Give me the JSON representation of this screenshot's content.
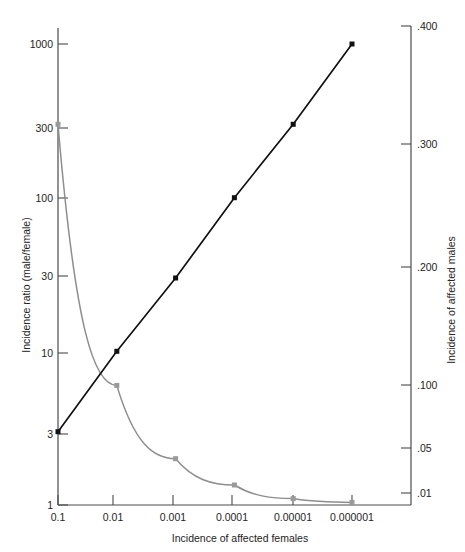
{
  "chart_data": {
    "type": "line",
    "title": "",
    "xlabel": "Incidence of affected females",
    "ylabel": "Incidence ratio (male/female)",
    "y2label": "Incidence of affected males",
    "xscale": "log",
    "yscale": "log",
    "y2scale": "log",
    "xticks": [
      "0.1",
      "0.01",
      "0.001",
      "0.0001",
      "0.00001",
      "0.000001"
    ],
    "xtick_values": [
      0.1,
      0.01,
      0.001,
      0.0001,
      1e-05,
      1e-06
    ],
    "yticks": [
      "1000",
      "300",
      "100",
      "30",
      "10",
      "3",
      "1"
    ],
    "ytick_values": [
      1000,
      300,
      100,
      30,
      10,
      3,
      1
    ],
    "ylim": [
      1,
      1000
    ],
    "y2ticks": [
      ".400",
      ".300",
      ".200",
      ".100",
      ".05",
      ".01"
    ],
    "y2tick_values": [
      0.4,
      0.3,
      0.2,
      0.1,
      0.05,
      0.01
    ],
    "y2lim": [
      0.0074,
      0.4
    ],
    "grid": false,
    "legend": "none",
    "series": [
      {
        "name": "Incidence of affected males",
        "color": "#111111",
        "axis": "right",
        "marker": "square",
        "x": [
          0.1,
          0.01,
          0.001,
          0.0001,
          1e-05,
          1e-06
        ],
        "values": [
          0.0548,
          0.1,
          0.1855,
          0.25,
          0.316,
          0.3855
        ],
        "left_axis_equivalent": [
          3,
          10,
          30,
          100,
          300,
          1000
        ]
      },
      {
        "name": "Incidence ratio (male/female)",
        "color": "#9a9a9a",
        "axis": "left",
        "marker": "square",
        "x": [
          0.1,
          0.01,
          0.001,
          0.0001,
          1e-05,
          1e-06
        ],
        "values": [
          300,
          6.0,
          2.0,
          1.35,
          1.1,
          1.04
        ]
      }
    ]
  }
}
